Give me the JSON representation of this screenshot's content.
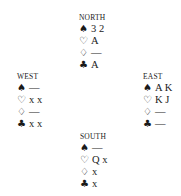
{
  "hands": {
    "north": {
      "label": "NORTH",
      "spades": "3 2",
      "hearts": "A",
      "diamonds": "—",
      "clubs": "A"
    },
    "west": {
      "label": "WEST",
      "spades": "—",
      "hearts": "x x",
      "diamonds": "—",
      "clubs": "x x"
    },
    "east": {
      "label": "EAST",
      "spades": "A K",
      "hearts": "K J",
      "diamonds": "—",
      "clubs": "—"
    },
    "south": {
      "label": "SOUTH",
      "spades": "—",
      "hearts": "Q x",
      "diamonds": "x",
      "clubs": "x"
    }
  },
  "suits": {
    "spades": "♠",
    "hearts": "♡",
    "diamonds": "♢",
    "clubs": "♣"
  }
}
